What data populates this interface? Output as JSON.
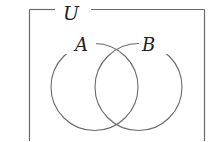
{
  "diagram": {
    "type": "venn",
    "universe_label": "U",
    "sets": [
      {
        "label": "A"
      },
      {
        "label": "B"
      }
    ],
    "colors": {
      "stroke": "#6a6a6a",
      "text": "#222222",
      "background": "#ffffff"
    }
  }
}
